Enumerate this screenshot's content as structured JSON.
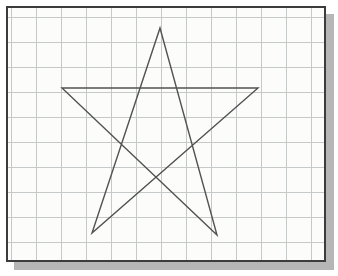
{
  "figure": {
    "colors": {
      "page_background": "#ffffff",
      "paper": "#fcfcfb",
      "grid_line": "#c6c9c9",
      "border": "#3c3c3c",
      "shadow": "#b6b6b6",
      "star_stroke": "#525252"
    },
    "panel": {
      "left": 6,
      "top": 6,
      "outer_width": 320,
      "outer_height": 256,
      "border_width": 2,
      "shadow_offset_x": 8,
      "shadow_offset_y": 8
    },
    "grid": {
      "spacing_px": 25,
      "offset_x": 3,
      "offset_y": 9,
      "columns": 13,
      "rows": 10
    },
    "star": {
      "shape": "pentagram",
      "closed": true,
      "stroke_width": 1.4,
      "viewbox_width": 316,
      "viewbox_height": 252,
      "points": [
        [
          152,
          20
        ],
        [
          209,
          227
        ],
        [
          54,
          80
        ],
        [
          250,
          80
        ],
        [
          84,
          225
        ]
      ],
      "vertex_names": [
        "top",
        "bottom-right",
        "left",
        "right",
        "bottom-left"
      ]
    }
  }
}
